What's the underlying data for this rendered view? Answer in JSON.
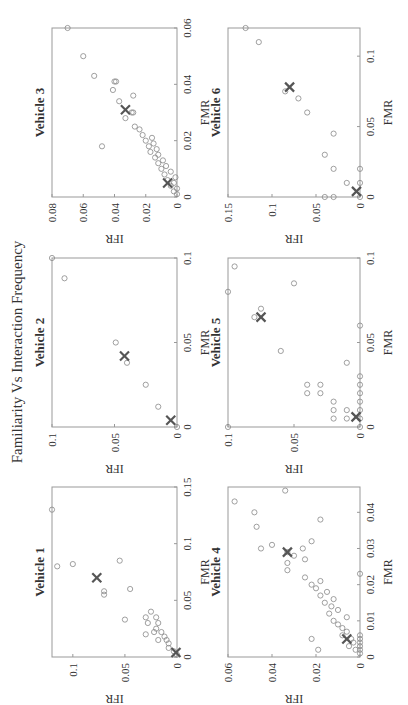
{
  "figure": {
    "title": "Familiarity Vs Interaction Frequency",
    "rotation_deg": -90,
    "colors": {
      "marker": "#888888",
      "cross": "#555555",
      "axis": "#999999",
      "text": "#333333"
    }
  },
  "chart_data": [
    {
      "type": "scatter",
      "title": "Vehicle 1",
      "xlabel": "FMR",
      "ylabel": "IFR",
      "xlim": [
        0,
        0.15
      ],
      "ylim": [
        0,
        0.12
      ],
      "xticks": [
        "0",
        "0.05",
        "0.1",
        "0.15"
      ],
      "yticks": [
        "0",
        "0.05",
        "0.1"
      ],
      "points": [
        [
          0.002,
          0.0
        ],
        [
          0.005,
          0.003
        ],
        [
          0.008,
          0.008
        ],
        [
          0.012,
          0.008
        ],
        [
          0.015,
          0.01
        ],
        [
          0.018,
          0.012
        ],
        [
          0.015,
          0.018
        ],
        [
          0.022,
          0.015
        ],
        [
          0.022,
          0.022
        ],
        [
          0.025,
          0.02
        ],
        [
          0.03,
          0.018
        ],
        [
          0.035,
          0.02
        ],
        [
          0.02,
          0.03
        ],
        [
          0.03,
          0.028
        ],
        [
          0.035,
          0.03
        ],
        [
          0.04,
          0.025
        ],
        [
          0.033,
          0.05
        ],
        [
          0.06,
          0.045
        ],
        [
          0.055,
          0.07
        ],
        [
          0.058,
          0.07
        ],
        [
          0.08,
          0.115
        ],
        [
          0.082,
          0.1
        ],
        [
          0.085,
          0.055
        ],
        [
          0.13,
          0.12
        ]
      ],
      "centroids": [
        [
          0.004,
          0.001
        ],
        [
          0.07,
          0.077
        ]
      ],
      "grid": false
    },
    {
      "type": "scatter",
      "title": "Vehicle 2",
      "xlabel": "FMR",
      "ylabel": "IFR",
      "xlim": [
        0,
        0.1
      ],
      "ylim": [
        0,
        0.1
      ],
      "xticks": [
        "0",
        "0.05",
        "0.1"
      ],
      "yticks": [
        "0",
        "0.05",
        "0.1"
      ],
      "points": [
        [
          0.0,
          0.0
        ],
        [
          0.012,
          0.015
        ],
        [
          0.025,
          0.025
        ],
        [
          0.038,
          0.04
        ],
        [
          0.05,
          0.049
        ],
        [
          0.088,
          0.09
        ],
        [
          0.1,
          0.1
        ]
      ],
      "centroids": [
        [
          0.004,
          0.005
        ],
        [
          0.042,
          0.042
        ]
      ],
      "grid": false
    },
    {
      "type": "scatter",
      "title": "Vehicle 3",
      "xlabel": "FMR",
      "ylabel": "IFR",
      "xlim": [
        0,
        0.06
      ],
      "ylim": [
        0,
        0.08
      ],
      "xticks": [
        "0",
        "0.02",
        "0.04",
        "0.06"
      ],
      "yticks": [
        "0",
        "0.02",
        "0.04",
        "0.06",
        "0.08"
      ],
      "points": [
        [
          0.001,
          0.0
        ],
        [
          0.002,
          0.002
        ],
        [
          0.003,
          0.0
        ],
        [
          0.004,
          0.004
        ],
        [
          0.005,
          0.002
        ],
        [
          0.006,
          0.006
        ],
        [
          0.007,
          0.001
        ],
        [
          0.008,
          0.008
        ],
        [
          0.009,
          0.004
        ],
        [
          0.01,
          0.01
        ],
        [
          0.011,
          0.007
        ],
        [
          0.012,
          0.012
        ],
        [
          0.013,
          0.009
        ],
        [
          0.014,
          0.014
        ],
        [
          0.015,
          0.012
        ],
        [
          0.016,
          0.017
        ],
        [
          0.017,
          0.013
        ],
        [
          0.018,
          0.018
        ],
        [
          0.019,
          0.015
        ],
        [
          0.02,
          0.02
        ],
        [
          0.021,
          0.016
        ],
        [
          0.022,
          0.022
        ],
        [
          0.024,
          0.024
        ],
        [
          0.025,
          0.027
        ],
        [
          0.028,
          0.033
        ],
        [
          0.03,
          0.028
        ],
        [
          0.03,
          0.029
        ],
        [
          0.034,
          0.037
        ],
        [
          0.036,
          0.028
        ],
        [
          0.038,
          0.041
        ],
        [
          0.041,
          0.039
        ],
        [
          0.041,
          0.04
        ],
        [
          0.043,
          0.053
        ],
        [
          0.05,
          0.06
        ],
        [
          0.06,
          0.07
        ],
        [
          0.018,
          0.048
        ]
      ],
      "centroids": [
        [
          0.005,
          0.006
        ],
        [
          0.031,
          0.033
        ]
      ],
      "grid": false
    },
    {
      "type": "scatter",
      "title": "Vehicle 4",
      "xlabel": "FMR",
      "ylabel": "IFR",
      "xlim": [
        0,
        0.047
      ],
      "ylim": [
        0,
        0.06
      ],
      "xticks": [
        "0",
        "0.01",
        "0.02",
        "0.03",
        "0.04"
      ],
      "yticks": [
        "0",
        "0.02",
        "0.04",
        "0.06"
      ],
      "points": [
        [
          0.001,
          0.0
        ],
        [
          0.002,
          0.0
        ],
        [
          0.003,
          0.0
        ],
        [
          0.004,
          0.0
        ],
        [
          0.005,
          0.0
        ],
        [
          0.006,
          0.0
        ],
        [
          0.002,
          0.002
        ],
        [
          0.003,
          0.005
        ],
        [
          0.004,
          0.003
        ],
        [
          0.005,
          0.004
        ],
        [
          0.006,
          0.008
        ],
        [
          0.007,
          0.006
        ],
        [
          0.008,
          0.008
        ],
        [
          0.009,
          0.01
        ],
        [
          0.01,
          0.012
        ],
        [
          0.011,
          0.006
        ],
        [
          0.012,
          0.014
        ],
        [
          0.013,
          0.01
        ],
        [
          0.014,
          0.013
        ],
        [
          0.015,
          0.016
        ],
        [
          0.016,
          0.012
        ],
        [
          0.017,
          0.018
        ],
        [
          0.018,
          0.015
        ],
        [
          0.019,
          0.02
        ],
        [
          0.02,
          0.022
        ],
        [
          0.021,
          0.018
        ],
        [
          0.022,
          0.025
        ],
        [
          0.023,
          0.0
        ],
        [
          0.024,
          0.033
        ],
        [
          0.026,
          0.033
        ],
        [
          0.027,
          0.025
        ],
        [
          0.028,
          0.03
        ],
        [
          0.029,
          0.033
        ],
        [
          0.03,
          0.045
        ],
        [
          0.03,
          0.026
        ],
        [
          0.031,
          0.04
        ],
        [
          0.032,
          0.022
        ],
        [
          0.036,
          0.047
        ],
        [
          0.038,
          0.018
        ],
        [
          0.043,
          0.057
        ],
        [
          0.046,
          0.034
        ],
        [
          0.005,
          0.022
        ],
        [
          0.002,
          0.019
        ],
        [
          0.04,
          0.048
        ]
      ],
      "centroids": [
        [
          0.005,
          0.006
        ],
        [
          0.029,
          0.033
        ]
      ],
      "grid": false
    },
    {
      "type": "scatter",
      "title": "Vehicle 5",
      "xlabel": "FMR",
      "ylabel": "IFR",
      "xlim": [
        0,
        0.1
      ],
      "ylim": [
        0,
        0.1
      ],
      "xticks": [
        "0",
        "0.05",
        "0.1"
      ],
      "yticks": [
        "0",
        "0.05",
        "0.1"
      ],
      "points": [
        [
          0.0,
          0.0
        ],
        [
          0.005,
          0.0
        ],
        [
          0.01,
          0.0
        ],
        [
          0.015,
          0.0
        ],
        [
          0.02,
          0.0
        ],
        [
          0.025,
          0.0
        ],
        [
          0.03,
          0.0
        ],
        [
          0.06,
          0.0
        ],
        [
          0.005,
          0.01
        ],
        [
          0.01,
          0.01
        ],
        [
          0.005,
          0.02
        ],
        [
          0.01,
          0.02
        ],
        [
          0.015,
          0.02
        ],
        [
          0.02,
          0.03
        ],
        [
          0.025,
          0.03
        ],
        [
          0.02,
          0.04
        ],
        [
          0.025,
          0.04
        ],
        [
          0.038,
          0.01
        ],
        [
          0.045,
          0.06
        ],
        [
          0.065,
          0.08
        ],
        [
          0.07,
          0.075
        ],
        [
          0.085,
          0.05
        ],
        [
          0.0,
          0.1
        ],
        [
          0.08,
          0.1
        ],
        [
          0.095,
          0.095
        ]
      ],
      "centroids": [
        [
          0.006,
          0.003
        ],
        [
          0.065,
          0.075
        ]
      ],
      "grid": false
    },
    {
      "type": "scatter",
      "title": "Vehicle 6",
      "xlabel": "FMR",
      "ylabel": "IFR",
      "xlim": [
        0,
        0.12
      ],
      "ylim": [
        0,
        0.15
      ],
      "xticks": [
        "0",
        "0.05",
        "0.1"
      ],
      "yticks": [
        "0",
        "0.05",
        "0.1",
        "0.15"
      ],
      "points": [
        [
          0.0,
          0.0
        ],
        [
          0.0,
          0.03
        ],
        [
          0.0,
          0.04
        ],
        [
          0.01,
          0.0
        ],
        [
          0.01,
          0.015
        ],
        [
          0.02,
          0.0
        ],
        [
          0.02,
          0.03
        ],
        [
          0.03,
          0.04
        ],
        [
          0.045,
          0.03
        ],
        [
          0.06,
          0.06
        ],
        [
          0.07,
          0.07
        ],
        [
          0.075,
          0.085
        ],
        [
          0.11,
          0.115
        ],
        [
          0.12,
          0.13
        ]
      ],
      "centroids": [
        [
          0.004,
          0.004
        ],
        [
          0.078,
          0.08
        ]
      ],
      "grid": false
    }
  ]
}
